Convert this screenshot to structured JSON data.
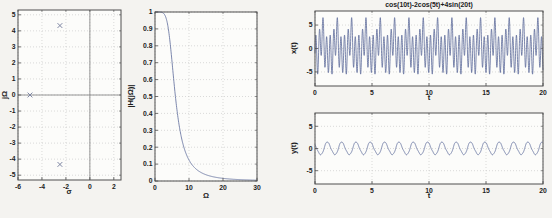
{
  "colors": {
    "page_background": "#f4f3f0",
    "plot_background": "#fcfcfa",
    "line": "#5c6a99",
    "marker": "#7e86a3",
    "grid": "#c3c3c3",
    "frame": "#4f4f4f",
    "axis_line": "#8a8a8a",
    "text": "#1c1c1c"
  },
  "chart_data": [
    {
      "id": "pole-zero-plot",
      "type": "scatter",
      "title": "",
      "xlabel": "σ",
      "ylabel": "jΩ",
      "xlim": [
        -6,
        2.6
      ],
      "ylim": [
        -5.3,
        5.3
      ],
      "xticks": [
        -6,
        -4,
        -2,
        0,
        2
      ],
      "yticks": [
        -5,
        -4,
        -3,
        -2,
        -1,
        0,
        1,
        2,
        3,
        4,
        5
      ],
      "grid": true,
      "zero_axis_lines": true,
      "marker": "x",
      "points": [
        [
          -5,
          0
        ],
        [
          -2.5,
          4.33
        ],
        [
          -2.5,
          -4.33
        ]
      ]
    },
    {
      "id": "magnitude-response-plot",
      "type": "line",
      "title": "",
      "xlabel": "Ω",
      "ylabel": "|H(jΩ)|",
      "xlim": [
        0,
        30
      ],
      "ylim": [
        0,
        1
      ],
      "xticks": [
        0,
        10,
        20,
        30
      ],
      "yticks": [
        0,
        0.1,
        0.2,
        0.3,
        0.4,
        0.5,
        0.6,
        0.7,
        0.8,
        0.9,
        1
      ],
      "grid": true,
      "zero_axis_lines": false,
      "function": {
        "kind": "butterworth_magnitude",
        "order": 3,
        "cutoff_rad_s": 5
      },
      "samples": 400
    },
    {
      "id": "input-signal-plot",
      "type": "line",
      "title": "cos(10t)-2cos(5t)+4sin(20t)",
      "xlabel": "t",
      "ylabel": "x(t)",
      "xlim": [
        0,
        20
      ],
      "ylim": [
        -8,
        8
      ],
      "xticks": [
        0,
        5,
        10,
        15,
        20
      ],
      "yticks": [
        -5,
        0,
        5
      ],
      "grid": true,
      "zero_axis_lines": false,
      "function": {
        "kind": "sinusoid_sum",
        "components": [
          {
            "waveform": "cos",
            "amplitude": 1,
            "frequency_rad_s": 10,
            "phase_rad": 0
          },
          {
            "waveform": "cos",
            "amplitude": -2,
            "frequency_rad_s": 5,
            "phase_rad": 0
          },
          {
            "waveform": "sin",
            "amplitude": 4,
            "frequency_rad_s": 20,
            "phase_rad": 0
          }
        ]
      },
      "samples": 2600
    },
    {
      "id": "output-signal-plot",
      "type": "line",
      "title": "",
      "xlabel": "t",
      "ylabel": "y(t)",
      "xlim": [
        0,
        20
      ],
      "ylim": [
        -8,
        8
      ],
      "xticks": [
        0,
        5,
        10,
        15,
        20
      ],
      "yticks": [
        -5,
        0,
        5
      ],
      "grid": true,
      "zero_axis_lines": false,
      "function": {
        "kind": "sinusoid_sum",
        "components": [
          {
            "waveform": "cos",
            "amplitude": 0.124,
            "frequency_rad_s": 10,
            "phase_rad": -3.6607
          },
          {
            "waveform": "cos",
            "amplitude": -1.4142,
            "frequency_rad_s": 5,
            "phase_rad": -2.3562
          },
          {
            "waveform": "sin",
            "amplitude": 0.0625,
            "frequency_rad_s": 20,
            "phase_rad": -4.2068
          }
        ]
      },
      "samples": 2600
    }
  ]
}
